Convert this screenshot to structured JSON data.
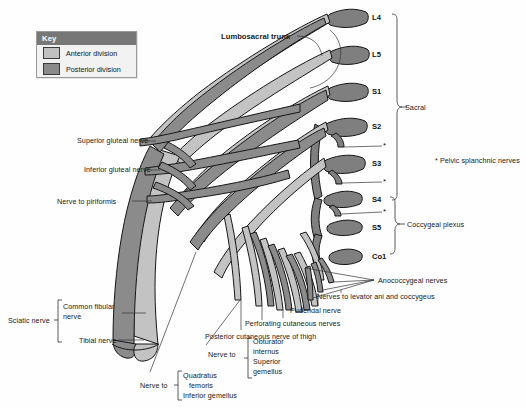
{
  "figure": {
    "background": "#fefefe",
    "colors": {
      "anterior_division": "#c0c0c0",
      "posterior_division": "#8a8a8a",
      "outline": "#1a1a1a",
      "leader_line": "#333333",
      "key_header": "#777777"
    }
  },
  "key": {
    "title": "Key",
    "items": [
      {
        "label": "Anterior division",
        "color": "#c0c0c0"
      },
      {
        "label": "Posterior division",
        "color": "#8a8a8a"
      }
    ]
  },
  "spinal_roots": [
    {
      "label": "L4",
      "x": 372,
      "y": 18
    },
    {
      "label": "L5",
      "x": 372,
      "y": 55
    },
    {
      "label": "S1",
      "x": 372,
      "y": 92
    },
    {
      "label": "S2",
      "x": 372,
      "y": 127
    },
    {
      "label": "S3",
      "x": 372,
      "y": 164
    },
    {
      "label": "S4",
      "x": 372,
      "y": 200
    },
    {
      "label": "S5",
      "x": 372,
      "y": 228
    },
    {
      "label": "Co1",
      "x": 372,
      "y": 257
    }
  ],
  "brackets": [
    {
      "name": "sacral",
      "label": "Sacral",
      "label_x": 405,
      "label_y": 108
    },
    {
      "name": "coccygeal-plexus",
      "label": "Coccygeal plexus",
      "label_x": 407,
      "label_y": 224
    },
    {
      "name": "sciatic-nerve",
      "label": "Sciatic nerve",
      "label_x": 8,
      "label_y": 318
    }
  ],
  "footnote": {
    "marker": "*",
    "text": "* Pelvic splanchnic nerves",
    "x": 435,
    "y": 159
  },
  "labels_left": [
    {
      "name": "superior-gluteal-nerve",
      "text": "Superior gluteal nerve",
      "x": 77,
      "y": 140
    },
    {
      "name": "inferior-gluteal-nerve",
      "text": "Inferior gluteal nerve",
      "x": 84,
      "y": 165
    },
    {
      "name": "nerve-to-piriformis",
      "text": "Nerve to piriformis",
      "x": 57,
      "y": 199
    }
  ],
  "labels_top": [
    {
      "name": "lumbosacral-trunk",
      "text": "Lumbosacral trunk",
      "x": 221,
      "y": 36,
      "bold": true
    }
  ],
  "labels_right": [
    {
      "name": "anococcygeal-nerves",
      "text": "Anococcygeal nerves",
      "x": 378,
      "y": 279
    },
    {
      "name": "nerves-to-levator-ani-and-coccygeus",
      "text": "Nerves to levator ani and coccygeus",
      "x": 317,
      "y": 295
    },
    {
      "name": "pudendal-nerve",
      "text": "Pudendal nerve",
      "x": 290,
      "y": 309
    },
    {
      "name": "perforating-cutaneous-nerves",
      "text": "Perforating cutaneous nerves",
      "x": 245,
      "y": 322
    },
    {
      "name": "posterior-cutaneous-nerve-of-thigh",
      "text": "Posterior cutaneous nerve of thigh",
      "x": 205,
      "y": 334
    }
  ],
  "sciatic": {
    "bracket_label": "Sciatic nerve",
    "branches": [
      {
        "name": "common-fibular-nerve",
        "text": "Common fibular nerve",
        "x": 62,
        "y": 306
      },
      {
        "name": "tibial-nerve",
        "text": "Tibial nerve",
        "x": 78,
        "y": 334
      }
    ]
  },
  "nerve_groups": [
    {
      "name": "nerve-to-obturator-internus-superior-gemellus",
      "prefix": "Nerve to",
      "prefix_x": 208,
      "prefix_y": 350,
      "bracket_x": 248,
      "bracket_y": 338,
      "bracket_h": 40,
      "items": [
        "Obturator",
        "internus",
        "Superior",
        "gemellus"
      ],
      "items_x": 253,
      "items_y": 338
    },
    {
      "name": "nerve-to-quadratus-femoris-inferior-gemellus",
      "prefix": "Nerve to",
      "prefix_x": 140,
      "prefix_y": 381,
      "bracket_x": 178,
      "bracket_y": 371,
      "bracket_h": 29,
      "items": [
        "Quadratus",
        "femoris",
        "Inferior gemellus"
      ],
      "items_x": 183,
      "items_y": 371
    }
  ],
  "asterisks": [
    {
      "x": 386,
      "y": 146
    },
    {
      "x": 386,
      "y": 182
    },
    {
      "x": 386,
      "y": 212
    }
  ]
}
